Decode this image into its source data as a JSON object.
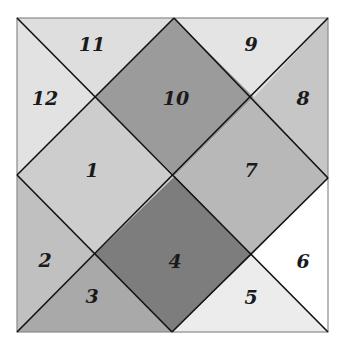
{
  "diagram": {
    "type": "divided-square",
    "square": {
      "left": 17,
      "top": 18,
      "right": 328,
      "bottom": 332
    },
    "regions": [
      {
        "id": "1",
        "label": "1",
        "color": "#cdcdcd",
        "label_pos": [
          92,
          170
        ]
      },
      {
        "id": "2",
        "label": "2",
        "color": "#c0c0c0",
        "label_pos": [
          45,
          260
        ]
      },
      {
        "id": "3",
        "label": "3",
        "color": "#a9a9a9",
        "label_pos": [
          92,
          296
        ]
      },
      {
        "id": "4",
        "label": "4",
        "color": "#7d7d7d",
        "label_pos": [
          175,
          261
        ]
      },
      {
        "id": "5",
        "label": "5",
        "color": "#ececec",
        "label_pos": [
          251,
          297
        ]
      },
      {
        "id": "6",
        "label": "6",
        "color": "#ffffff",
        "label_pos": [
          303,
          261
        ]
      },
      {
        "id": "7",
        "label": "7",
        "color": "#b8b8b8",
        "label_pos": [
          251,
          170
        ]
      },
      {
        "id": "8",
        "label": "8",
        "color": "#c6c6c6",
        "label_pos": [
          303,
          98
        ]
      },
      {
        "id": "9",
        "label": "9",
        "color": "#e4e4e4",
        "label_pos": [
          251,
          44
        ]
      },
      {
        "id": "10",
        "label": "10",
        "color": "#9b9b9b",
        "label_pos": [
          176,
          98
        ]
      },
      {
        "id": "11",
        "label": "11",
        "color": "#dedede",
        "label_pos": [
          92,
          44
        ]
      },
      {
        "id": "12",
        "label": "12",
        "color": "#e2e2e2",
        "label_pos": [
          45,
          98
        ]
      }
    ],
    "line_color": "#111111",
    "border_color": "#8a8a8a"
  }
}
